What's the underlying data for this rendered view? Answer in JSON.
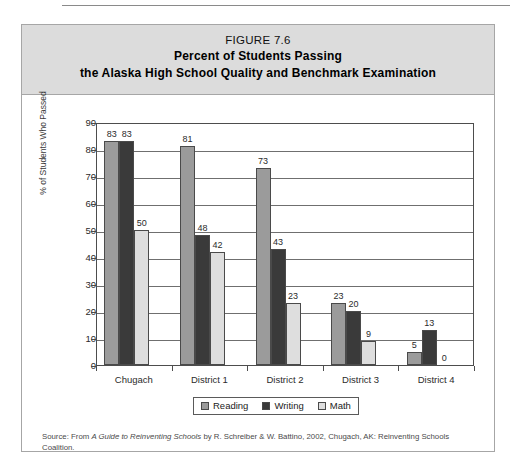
{
  "figure": {
    "number_label": "FIGURE 7.6",
    "title_line_1": "Percent of Students Passing",
    "title_line_2": "the Alaska High School Quality and Benchmark Examination",
    "source_prefix": "Source: From ",
    "source_italic": "A Guide to Reinventing Schools",
    "source_suffix": " by R. Schreiber & W. Battino, 2002, Chugach, AK: Reinventing Schools Coalition."
  },
  "colors": {
    "reading": "#9b9b9b",
    "writing": "#3a3a3a",
    "math": "#dedede",
    "band": "#dcdcdc",
    "border": "#a6a6a6",
    "axis": "#4d4d4d",
    "grid": "#6f6f6f"
  },
  "chart_data": {
    "type": "bar",
    "title": "Percent of Students Passing the Alaska High School Quality and Benchmark Examination",
    "xlabel": "",
    "ylabel": "% of Students Who Passed",
    "categories": [
      "Chugach",
      "District 1",
      "District 2",
      "District 3",
      "District 4"
    ],
    "series": [
      {
        "name": "Reading",
        "color": "#9b9b9b",
        "values": [
          83,
          81,
          73,
          23,
          5
        ]
      },
      {
        "name": "Writing",
        "color": "#3a3a3a",
        "values": [
          83,
          48,
          43,
          20,
          13
        ]
      },
      {
        "name": "Math",
        "color": "#dedede",
        "values": [
          50,
          42,
          23,
          9,
          0
        ]
      }
    ],
    "ylim": [
      0,
      90
    ],
    "yticks": [
      0,
      10,
      20,
      30,
      40,
      50,
      60,
      70,
      80,
      90
    ],
    "grid": true,
    "legend_position": "bottom-center"
  }
}
